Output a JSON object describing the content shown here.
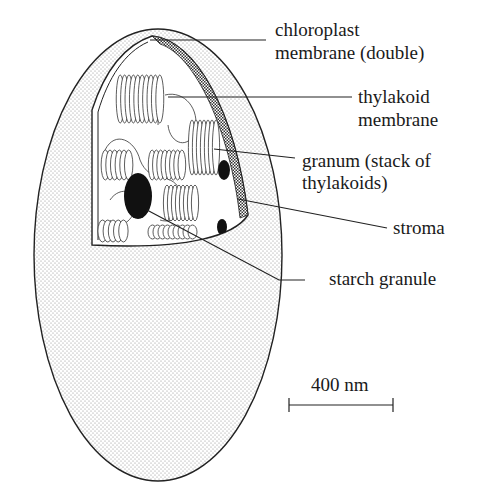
{
  "figure": {
    "labels": [
      {
        "id": "chloroplast-membrane",
        "lines": [
          "chloroplast",
          "membrane (double)"
        ]
      },
      {
        "id": "thylakoid-membrane",
        "lines": [
          "thylakoid",
          "membrane"
        ]
      },
      {
        "id": "granum",
        "lines": [
          "granum (stack of",
          "thylakoids)"
        ]
      },
      {
        "id": "stroma",
        "lines": [
          "stroma"
        ]
      },
      {
        "id": "starch-granule",
        "lines": [
          "starch granule"
        ]
      }
    ],
    "scale_bar": {
      "label": "400 nm"
    },
    "colors": {
      "ink": "#1a1a1a",
      "stipple": "#9a9a9a",
      "background": "#ffffff"
    }
  }
}
